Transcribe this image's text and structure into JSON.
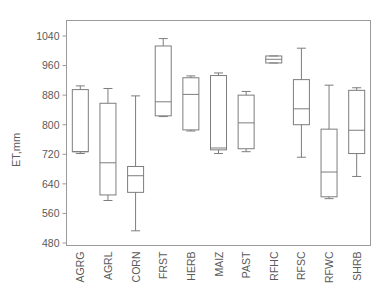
{
  "chart_data": {
    "type": "box",
    "title": "",
    "subtitle": "",
    "xlabel": "",
    "ylabel": "ET,mm",
    "ylim": [
      480,
      1060
    ],
    "yticks": [
      480,
      560,
      640,
      720,
      800,
      880,
      960,
      1040
    ],
    "ytick_labels": [
      "480",
      "560",
      "640",
      "720",
      "800",
      "880",
      "960",
      "1040"
    ],
    "grid": false,
    "legend": "none",
    "categories": [
      "AGRG",
      "AGRL",
      "CORN",
      "FRST",
      "HERB",
      "MAIZ",
      "PAST",
      "RFHC",
      "RFSC",
      "RFWC",
      "SHRB"
    ],
    "boxes": [
      {
        "label": "AGRG",
        "whisker_low": 722,
        "q1": 727,
        "median": 727,
        "q3": 895,
        "whisker_high": 905
      },
      {
        "label": "AGRL",
        "whisker_low": 595,
        "q1": 610,
        "median": 697,
        "q3": 858,
        "whisker_high": 898
      },
      {
        "label": "CORN",
        "whisker_low": 513,
        "q1": 617,
        "median": 662,
        "q3": 687,
        "whisker_high": 878
      },
      {
        "label": "FRST",
        "whisker_low": 822,
        "q1": 824,
        "median": 862,
        "q3": 1013,
        "whisker_high": 1033
      },
      {
        "label": "HERB",
        "whisker_low": 783,
        "q1": 786,
        "median": 882,
        "q3": 927,
        "whisker_high": 932
      },
      {
        "label": "MAIZ",
        "whisker_low": 722,
        "q1": 732,
        "median": 737,
        "q3": 933,
        "whisker_high": 940
      },
      {
        "label": "PAST",
        "whisker_low": 727,
        "q1": 735,
        "median": 805,
        "q3": 880,
        "whisker_high": 890
      },
      {
        "label": "RFHC",
        "whisker_low": 967,
        "q1": 967,
        "median": 977,
        "q3": 986,
        "whisker_high": 986
      },
      {
        "label": "RFSC",
        "whisker_low": 712,
        "q1": 800,
        "median": 843,
        "q3": 922,
        "whisker_high": 1007
      },
      {
        "label": "RFWC",
        "whisker_low": 600,
        "q1": 605,
        "median": 672,
        "q3": 788,
        "whisker_high": 907
      },
      {
        "label": "SHRB",
        "whisker_low": 660,
        "q1": 722,
        "median": 785,
        "q3": 893,
        "whisker_high": 900
      }
    ]
  },
  "style": {
    "axis_color": "#9a9a9a",
    "box_color": "#7d7d7d",
    "text_color": "#5a5a5a",
    "background": "#ffffff"
  }
}
